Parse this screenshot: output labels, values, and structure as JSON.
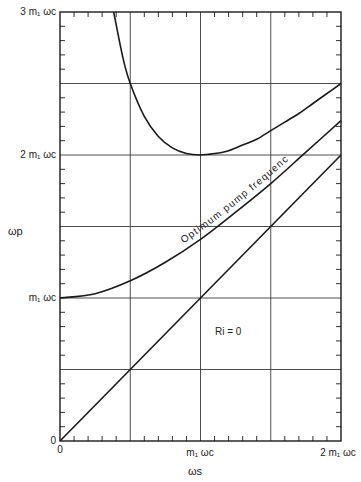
{
  "chart_data": {
    "type": "line",
    "title": "",
    "xlabel": "ω_s",
    "ylabel": "ω_p",
    "xlim": [
      0,
      2
    ],
    "ylim": [
      0,
      3
    ],
    "grid": true,
    "x_gridlines": [
      0.5,
      1.0,
      1.5
    ],
    "y_gridlines": [
      0.5,
      1.0,
      1.5,
      2.0,
      2.5
    ],
    "x_ticks": [
      {
        "value": 0,
        "label": "0"
      },
      {
        "value": 1,
        "label": "m₁ ω_c"
      },
      {
        "value": 2,
        "label": "2 m₁ ω_c"
      }
    ],
    "y_ticks": [
      {
        "value": 0,
        "label": "0"
      },
      {
        "value": 1,
        "label": "m₁ ω_c"
      },
      {
        "value": 2,
        "label": "2 m₁ ω_c"
      },
      {
        "value": 3,
        "label": "3 m₁ ω_c"
      }
    ],
    "units": "multiples of m₁ω_c",
    "series": [
      {
        "name": "Upper boundary curve",
        "x": [
          0.382,
          0.45,
          0.5,
          0.6,
          0.7,
          0.8,
          0.9,
          1.0,
          1.1,
          1.2,
          1.3,
          1.4,
          1.5,
          1.6,
          1.7,
          1.8,
          1.9,
          2.0
        ],
        "y": [
          3.0,
          2.67,
          2.5,
          2.27,
          2.13,
          2.05,
          2.01,
          2.0,
          2.01,
          2.03,
          2.07,
          2.11,
          2.17,
          2.23,
          2.29,
          2.36,
          2.43,
          2.5
        ]
      },
      {
        "name": "Optimum pump frequency",
        "x": [
          0,
          0.25,
          0.5,
          0.75,
          1.0,
          1.25,
          1.5,
          1.75,
          2.0
        ],
        "y": [
          1.0,
          1.03,
          1.12,
          1.25,
          1.41,
          1.6,
          1.8,
          2.02,
          2.24
        ]
      },
      {
        "name": "R_i = 0 line (ω_p = ω_s)",
        "x": [
          0,
          0.5,
          1.0,
          1.5,
          2.0
        ],
        "y": [
          0,
          0.5,
          1.0,
          1.5,
          2.0
        ]
      }
    ],
    "annotations": [
      {
        "text": "Optimum pump frequency",
        "along_series": "Optimum pump frequency",
        "x_range": [
          0.9,
          1.65
        ]
      },
      {
        "text": "R_i = 0",
        "x": 1.2,
        "y": 0.85
      }
    ]
  },
  "labels": {
    "ylabel": "ωp",
    "xlabel": "ωs",
    "ytick_3": "3 m₁ ωc",
    "ytick_2": "2 m₁ ωc",
    "ytick_1": "m₁ ωc",
    "ytick_0": "0",
    "xtick_0": "0",
    "xtick_1": "m₁ ωc",
    "xtick_2": "2 m₁ ωc",
    "curve_label": "Optimum pump frequency",
    "ri_label": "Ri = 0"
  },
  "style": {
    "line_color": "#1a1a1a",
    "grid_color": "#3a3a3a",
    "background": "#ffffff"
  }
}
